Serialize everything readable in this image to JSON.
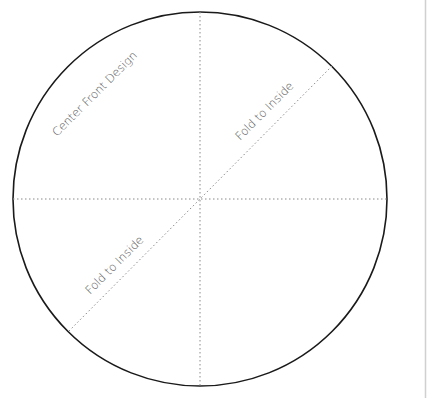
{
  "diagram": {
    "shape": "circle",
    "labels": {
      "center_front": "Center Front Design",
      "fold_upper": "Fold to Inside",
      "fold_lower": "Fold to Inside"
    },
    "colors": {
      "outline": "#1a1a1a",
      "fold_lines": "#8a8a8a",
      "text": "#555555",
      "page_edge": "#d0d0d0",
      "background": "#ffffff"
    }
  }
}
